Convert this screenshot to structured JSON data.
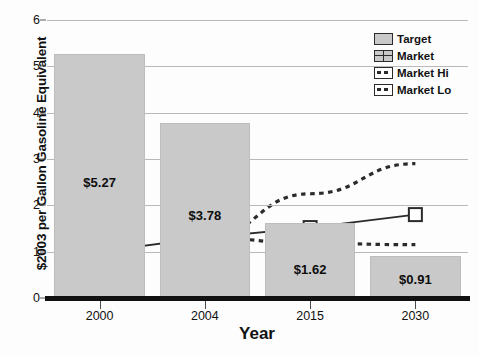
{
  "chart_data": {
    "type": "bar",
    "title": "",
    "xlabel": "Year",
    "ylabel": "$2003 per Gallon Gasoline Equivalent",
    "categories": [
      "2000",
      "2004",
      "2015",
      "2030"
    ],
    "ylim": [
      0,
      6
    ],
    "yticks": [
      0,
      1,
      2,
      3,
      4,
      5,
      6
    ],
    "grid": true,
    "legend_position": "top-right",
    "series": [
      {
        "name": "Target",
        "type": "bar",
        "values": [
          5.27,
          3.78,
          1.62,
          0.91
        ],
        "data_labels": [
          "$5.27",
          "$3.78",
          "$1.62",
          "$0.91"
        ],
        "color": "#c9c9c9"
      },
      {
        "name": "Market",
        "type": "line",
        "values": [
          1.0,
          1.3,
          1.52,
          1.8
        ],
        "color": "#3a3a3a",
        "marker": "open-square"
      },
      {
        "name": "Market Hi",
        "type": "line",
        "values": [
          null,
          1.3,
          2.25,
          2.9
        ],
        "color": "#2b2b2b",
        "style": "dotted"
      },
      {
        "name": "Market Lo",
        "type": "line",
        "values": [
          null,
          1.3,
          1.18,
          1.15
        ],
        "color": "#2b2b2b",
        "style": "dotted"
      }
    ]
  },
  "legend": {
    "items": [
      {
        "label": "Target",
        "swatch": "solid-fill"
      },
      {
        "label": "Market",
        "swatch": "grid-box"
      },
      {
        "label": "Market Hi",
        "swatch": "dashed-line"
      },
      {
        "label": "Market Lo",
        "swatch": "dashed-line"
      }
    ]
  },
  "axes": {
    "y_tick_labels": [
      "0",
      "1",
      "2",
      "3",
      "4",
      "5",
      "6"
    ],
    "x_tick_labels": [
      "2000",
      "2004",
      "2015",
      "2030"
    ],
    "y_title": "$2003 per Gallon Gasoline Equivalent",
    "x_title": "Year"
  }
}
